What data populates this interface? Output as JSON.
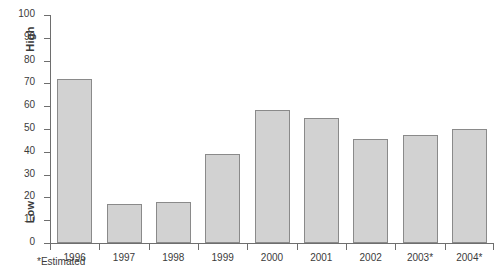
{
  "chart_data": {
    "type": "bar",
    "title": "",
    "xlabel": "",
    "ylabel": "",
    "categories": [
      "1996",
      "1997",
      "1998",
      "1999",
      "2000",
      "2001",
      "2002",
      "2003*",
      "2004*"
    ],
    "values": [
      72,
      17,
      18,
      39,
      58.5,
      55,
      45.5,
      47.5,
      50
    ],
    "ylim": [
      0,
      100
    ],
    "y_ticks": [
      0,
      10,
      20,
      30,
      40,
      50,
      60,
      70,
      80,
      90,
      100
    ],
    "y_tick_labels": [
      "0",
      "10",
      "20",
      "30",
      "40",
      "50",
      "60",
      "70",
      "80",
      "90",
      "100"
    ],
    "grid": false,
    "legend": null,
    "axis_annotations": {
      "high_label": "High",
      "low_label": "Low"
    },
    "annotations": [
      "*Estimated"
    ],
    "bar_fill_color": "#d2d2d2",
    "bar_border_color": "#8a8a8a",
    "axis_color": "#6e6e6e",
    "text_color": "#3b3b3b",
    "background_color": "#ffffff"
  },
  "footnote": {
    "text": "*Estimated"
  }
}
